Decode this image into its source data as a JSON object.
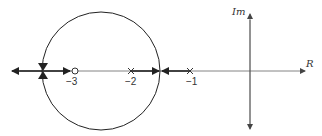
{
  "diagram": {
    "type": "root-locus",
    "axes": {
      "real_label": "R",
      "imag_label": "Im"
    },
    "zeros": [
      {
        "value": -3,
        "label": "−3"
      }
    ],
    "poles": [
      {
        "value": -2,
        "label": "−2"
      },
      {
        "value": -1,
        "label": "−1"
      }
    ],
    "locus_circle": {
      "center": -3,
      "radius": 2
    },
    "colors": {
      "stroke": "#222222",
      "axis": "#555555"
    }
  }
}
